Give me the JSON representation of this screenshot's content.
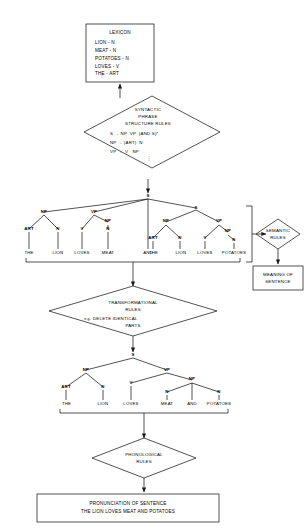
{
  "diagram": {
    "stroke_color": "#1a1a1a",
    "background_color": "#ffffff"
  },
  "lexicon_box": {
    "name": "lexicon",
    "title": "LEXICON",
    "entries": [
      "LION - N",
      "MEAT - N",
      "POTATOES - N",
      "LOVES - V",
      "THE - ART"
    ],
    "continuation": "⋮"
  },
  "syntactic_diamond": {
    "name": "syntactic-phrase-structure-rules",
    "title_lines": [
      "SYNTACTIC",
      "PHRASE",
      "STRUCTURE RULES"
    ],
    "rules": [
      "S → NP  VP  (AND S)*",
      "NP → (ART)  N",
      "VP →  V   NP"
    ],
    "continuation": "⋮"
  },
  "deep_structure_tree": {
    "name": "deep-structure-tree",
    "root": "S",
    "nodes": {
      "s_left": "S",
      "s_right": "S",
      "np1": "NP",
      "vp1": "VP",
      "art1": "ART",
      "n1": "N",
      "v1": "V",
      "np2": "NP",
      "n2": "N",
      "np3": "NP",
      "vp2": "VP",
      "art2": "ART",
      "n3": "N",
      "v2": "V",
      "np4": "NP",
      "n4": "N"
    },
    "terminals": [
      "THE",
      "LION",
      "LOVES",
      "MEAT",
      "AND",
      "THE",
      "LION",
      "LOVES",
      "POTATOES"
    ]
  },
  "semantic_diamond": {
    "name": "semantic-rules",
    "lines": [
      "SEMANTIC",
      "RULES"
    ]
  },
  "meaning_box": {
    "name": "meaning-of-sentence",
    "lines": [
      "MEANING OF",
      "SENTENCE"
    ]
  },
  "transformational_diamond": {
    "name": "transformational-rules",
    "title_lines": [
      "TRANSFORMATIONAL",
      "RULES"
    ],
    "example_prefix": "e.g.",
    "example": "DELETE IDENTICAL",
    "example_line2": "PARTS"
  },
  "surface_structure_tree": {
    "name": "surface-structure-tree",
    "root": "S",
    "nodes": {
      "np1": "NP",
      "vp1": "VP",
      "art1": "ART",
      "n1": "N",
      "v1": "V",
      "np2": "NP",
      "n2": "N",
      "n3": "N"
    },
    "terminals": [
      "THE",
      "LION",
      "LOVES",
      "MEAT",
      "AND",
      "POTATOES"
    ]
  },
  "phonological_diamond": {
    "name": "phonological-rules",
    "lines": [
      "PHONOLOGICAL",
      "RULES"
    ]
  },
  "pronunciation_box": {
    "name": "pronunciation-of-sentence",
    "line1": "PRONUNCIATION OF SENTENCE",
    "line2": "THE LION LOVES MEAT AND POTATOES"
  }
}
